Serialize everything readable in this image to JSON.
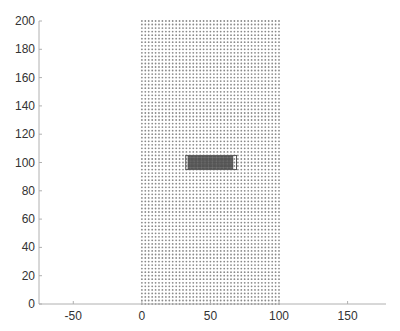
{
  "chart_data": {
    "type": "scatter",
    "title": "",
    "xlabel": "",
    "ylabel": "",
    "xlim": [
      -75,
      178
    ],
    "ylim": [
      0,
      200
    ],
    "grid": false,
    "x_ticks": [
      -50,
      0,
      50,
      100,
      150
    ],
    "y_ticks": [
      0,
      20,
      40,
      60,
      80,
      100,
      120,
      140,
      160,
      180,
      200
    ],
    "series": [
      {
        "name": "grid points",
        "description": "dense regular grid of small gray markers",
        "x_range": [
          0,
          100
        ],
        "y_range": [
          0,
          200
        ],
        "spacing": 2.5,
        "color": "#8a8a8a"
      },
      {
        "name": "dense region",
        "description": "darker highlighted block of points inside a rectangle",
        "x_range": [
          34,
          66
        ],
        "y_range": [
          96,
          104
        ],
        "color": "#555555"
      }
    ],
    "annotations": [
      {
        "type": "rectangle",
        "x": [
          32,
          69
        ],
        "y": [
          95,
          105
        ],
        "color": "#555555"
      }
    ]
  },
  "colors": {
    "axis": "#b0b0b0",
    "points": "#8a8a8a",
    "dense": "#5a5a5a"
  }
}
